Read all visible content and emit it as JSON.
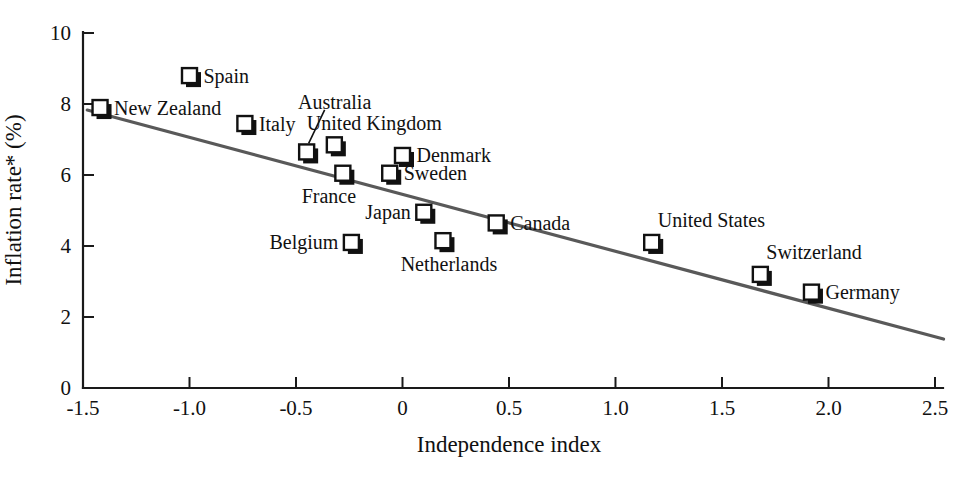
{
  "chart_data": {
    "type": "scatter",
    "title": "",
    "xlabel": "Independence index",
    "ylabel": "Inflation rate* (%)",
    "xlim": [
      -1.5,
      2.5
    ],
    "ylim": [
      0,
      10
    ],
    "xticks": [
      "-1.5",
      "-1.0",
      "-0.5",
      "0",
      "0.5",
      "1.0",
      "1.5",
      "2.0",
      "2.5"
    ],
    "xtick_values": [
      -1.5,
      -1.0,
      -0.5,
      0,
      0.5,
      1.0,
      1.5,
      2.0,
      2.5
    ],
    "yticks": [
      "0",
      "2",
      "4",
      "6",
      "8",
      "10"
    ],
    "ytick_values": [
      0,
      2,
      4,
      6,
      8,
      10
    ],
    "grid": false,
    "legend": "none",
    "marker_style": "open-square-with-shadow",
    "marker_color": "#ffffff",
    "marker_edge_color": "#111111",
    "axis_color": "#1a1a1a",
    "points": [
      {
        "label": "New Zealand",
        "x": -1.42,
        "y": 7.9,
        "label_side": "right"
      },
      {
        "label": "Spain",
        "x": -1.0,
        "y": 8.8,
        "label_side": "right"
      },
      {
        "label": "Italy",
        "x": -0.74,
        "y": 7.45,
        "label_side": "right"
      },
      {
        "label": "Australia",
        "x": -0.45,
        "y": 6.65,
        "label_side": "leader"
      },
      {
        "label": "United Kingdom",
        "x": -0.32,
        "y": 6.85,
        "label_side": "above"
      },
      {
        "label": "France",
        "x": -0.28,
        "y": 6.05,
        "label_side": "below-left"
      },
      {
        "label": "Denmark",
        "x": 0.0,
        "y": 6.55,
        "label_side": "right"
      },
      {
        "label": "Sweden",
        "x": -0.06,
        "y": 6.05,
        "label_side": "right"
      },
      {
        "label": "Belgium",
        "x": -0.24,
        "y": 4.1,
        "label_side": "left"
      },
      {
        "label": "Japan",
        "x": 0.1,
        "y": 4.95,
        "label_side": "left"
      },
      {
        "label": "Netherlands",
        "x": 0.19,
        "y": 4.15,
        "label_side": "below"
      },
      {
        "label": "Canada",
        "x": 0.44,
        "y": 4.65,
        "label_side": "right"
      },
      {
        "label": "United States",
        "x": 1.17,
        "y": 4.1,
        "label_side": "above-right"
      },
      {
        "label": "Switzerland",
        "x": 1.68,
        "y": 3.2,
        "label_side": "above-right"
      },
      {
        "label": "Germany",
        "x": 1.92,
        "y": 2.7,
        "label_side": "right"
      }
    ],
    "trendline": {
      "name": "fitted regression line",
      "color": "#595959",
      "x_start": -1.48,
      "y_start": 7.83,
      "x_end": 2.54,
      "y_end": 1.38
    }
  }
}
